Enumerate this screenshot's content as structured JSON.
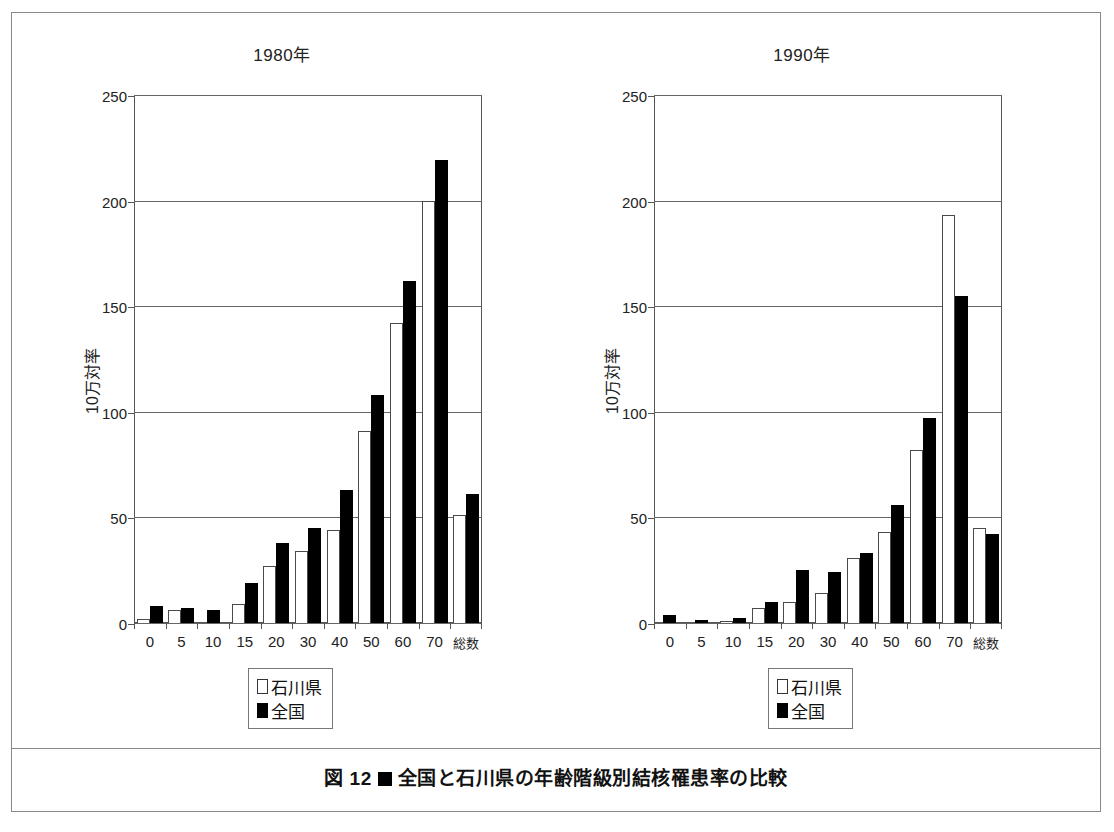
{
  "figure": {
    "caption_prefix": "図 12",
    "caption_text": "全国と石川県の年齢階級別結核罹患率の比較",
    "marker_icon": "black-square-icon"
  },
  "legend": {
    "prefecture_label": "石川県",
    "national_label": "全国",
    "prefecture_color": "#ffffff",
    "national_color": "#000000"
  },
  "axis": {
    "ylabel": "10万対率",
    "yticks": [
      "0",
      "50",
      "100",
      "150",
      "200",
      "250"
    ]
  },
  "chart_data": [
    {
      "type": "bar",
      "title": "1980年",
      "xlabel": "",
      "ylabel": "10万対率",
      "ylim": [
        0,
        250
      ],
      "yticks": [
        0,
        50,
        100,
        150,
        200,
        250
      ],
      "grid": true,
      "legend_position": "below-center",
      "categories": [
        "0",
        "5",
        "10",
        "15",
        "20",
        "30",
        "40",
        "50",
        "60",
        "70",
        "総数"
      ],
      "series": [
        {
          "name": "石川県",
          "color": "#ffffff",
          "values": [
            2,
            6,
            0,
            9,
            27,
            34,
            44,
            91,
            142,
            200,
            51
          ]
        },
        {
          "name": "全国",
          "color": "#000000",
          "values": [
            8,
            7,
            6,
            19,
            38,
            45,
            63,
            108,
            162,
            219,
            61
          ]
        }
      ]
    },
    {
      "type": "bar",
      "title": "1990年",
      "xlabel": "",
      "ylabel": "10万対率",
      "ylim": [
        0,
        250
      ],
      "yticks": [
        0,
        50,
        100,
        150,
        200,
        250
      ],
      "grid": true,
      "legend_position": "below-center",
      "categories": [
        "0",
        "5",
        "10",
        "15",
        "20",
        "30",
        "40",
        "50",
        "60",
        "70",
        "総数"
      ],
      "series": [
        {
          "name": "石川県",
          "color": "#ffffff",
          "values": [
            0,
            0,
            1,
            7,
            10,
            14,
            31,
            43,
            82,
            193,
            45
          ]
        },
        {
          "name": "全国",
          "color": "#000000",
          "values": [
            4,
            1.5,
            2.5,
            10,
            25,
            24,
            33,
            56,
            97,
            155,
            42
          ]
        }
      ]
    }
  ]
}
